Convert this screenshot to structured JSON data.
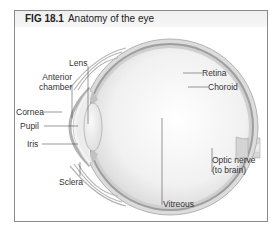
{
  "figure": {
    "number": "FIG 18.1",
    "title": "Anatomy of the eye"
  },
  "labels": {
    "lens": "Lens",
    "anterior_chamber_line1": "Anterior",
    "anterior_chamber_line2": "chamber",
    "cornea": "Cornea",
    "pupil": "Pupil",
    "iris": "Iris",
    "sclera": "Sclera",
    "retina": "Retina",
    "choroid": "Choroid",
    "optic_nerve_line1": "Optic nerve",
    "optic_nerve_line2": "(to brain)",
    "vitreous": "Vitreous"
  },
  "colors": {
    "frame_border": "#8a8a8a",
    "title_bar": "#f0f0f0",
    "sclera": "#d6d6d6",
    "choroid": "#9a9a9a",
    "vitreous": "#f2f2f2",
    "leader_line": "#333333"
  }
}
